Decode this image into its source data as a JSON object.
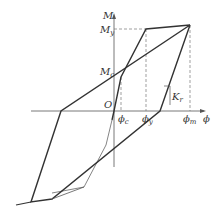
{
  "diagram": {
    "type": "moment-curvature hysteresis model",
    "axes": {
      "y_label": "M",
      "x_label": "ϕ",
      "origin_label": "O"
    },
    "labels": {
      "My_main": "M",
      "My_sub": "y",
      "Mc_main": "M",
      "Mc_sub": "c",
      "phic_main": "ϕ",
      "phic_sub": "c",
      "phiy_main": "ϕ",
      "phiy_sub": "y",
      "phim_main": "ϕ",
      "phim_sub": "m",
      "Kr_main": "K",
      "Kr_sub": "r"
    },
    "colors": {
      "line": "#333333",
      "thin": "#666666",
      "axis": "#555555"
    }
  }
}
